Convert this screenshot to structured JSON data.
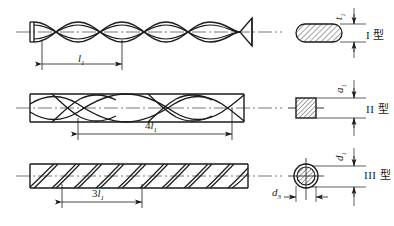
{
  "figure": {
    "title": "",
    "background_color": "#ffffff",
    "line_color": "#1a1a1a",
    "rows": [
      {
        "id": "row-1",
        "rod_name": "twisted-flat-bar",
        "rod_description": "twisted flat ribbon bar with conical point at right end",
        "pitch_label_prefix": "",
        "pitch_label_symbol": "l",
        "pitch_label_sub": "1",
        "pitch_label_text": "l1",
        "section_name": "oval-hatched-section",
        "section_shape": "oval",
        "section_dim_symbol": "t",
        "section_dim_sub": "1",
        "section_dim_text": "t1",
        "type_label": "I 型"
      },
      {
        "id": "row-2",
        "rod_name": "twisted-square-bar",
        "rod_description": "twisted square bar, helical twist along length",
        "pitch_label_prefix": "4",
        "pitch_label_symbol": "l",
        "pitch_label_sub": "1",
        "pitch_label_text": "4l1",
        "section_name": "square-hatched-section",
        "section_shape": "square",
        "section_dim_symbol": "a",
        "section_dim_sub": "1",
        "section_dim_text": "a1",
        "type_label": "II 型"
      },
      {
        "id": "row-3",
        "rod_name": "helical-grooved-round-bar",
        "rod_description": "cylindrical bar with helical surface grooves",
        "pitch_label_prefix": "3",
        "pitch_label_symbol": "l",
        "pitch_label_sub": "1",
        "pitch_label_text": "3l1",
        "section_name": "circular-ring-section",
        "section_shape": "circle",
        "section_dim_symbol": "d",
        "section_dim_sub": "1",
        "section_dim_text": "d1",
        "section_dim2_symbol": "d",
        "section_dim2_sub": "3",
        "section_dim2_text": "d3",
        "type_label": "III 型"
      }
    ]
  }
}
